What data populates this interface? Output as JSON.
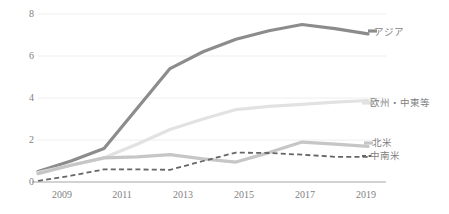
{
  "chart_data": {
    "type": "line",
    "title": "",
    "xlabel": "",
    "ylabel": "",
    "grid": true,
    "legend_position": "right-inline",
    "x": [
      2009,
      2010,
      2011,
      2012,
      2013,
      2014,
      2015,
      2016,
      2017,
      2018,
      2019
    ],
    "x_tick_labels": [
      "2009",
      "2011",
      "2013",
      "2015",
      "2017",
      "2019"
    ],
    "x_ticks": [
      2009,
      2011,
      2013,
      2015,
      2017,
      2019
    ],
    "y_tick_labels": [
      "0",
      "2",
      "4",
      "6",
      "8"
    ],
    "y_ticks": [
      0,
      2,
      4,
      6,
      8
    ],
    "ylim": [
      0,
      8
    ],
    "xlim": [
      2009,
      2019
    ],
    "series": [
      {
        "name": "アジア",
        "color": "#8c8c8c",
        "style": "solid",
        "width": 3.2,
        "values": [
          0.5,
          1.0,
          1.6,
          3.5,
          5.4,
          6.2,
          6.8,
          7.2,
          7.5,
          7.3,
          7.05
        ]
      },
      {
        "name": "欧州・中東等",
        "color": "#e2e2e2",
        "style": "solid",
        "width": 3.2,
        "values": [
          0.45,
          0.8,
          1.15,
          1.8,
          2.5,
          3.0,
          3.45,
          3.6,
          3.7,
          3.8,
          3.88
        ]
      },
      {
        "name": "北米",
        "color": "#c6c6c6",
        "style": "solid",
        "width": 3.2,
        "values": [
          0.4,
          0.8,
          1.15,
          1.2,
          1.3,
          1.1,
          0.95,
          1.4,
          1.9,
          1.8,
          1.7
        ]
      },
      {
        "name": "中南米",
        "color": "#666666",
        "style": "dashed",
        "width": 1.8,
        "values": [
          0.05,
          0.3,
          0.6,
          0.6,
          0.58,
          1.0,
          1.4,
          1.38,
          1.3,
          1.2,
          1.2
        ]
      }
    ]
  },
  "axis": {
    "y_labels": [
      "8",
      "6",
      "4",
      "2",
      "0"
    ],
    "x_labels": [
      "2009",
      "2011",
      "2013",
      "2015",
      "2017",
      "2019"
    ]
  },
  "labels": {
    "asia": "アジア",
    "europe_middle_east": "欧州・中東等",
    "north_america": "北米",
    "latin_america": "中南米"
  },
  "colors": {
    "asia": "#8c8c8c",
    "europe_middle_east": "#e2e2e2",
    "north_america": "#c6c6c6",
    "latin_america": "#666666",
    "gridline": "#eeeeee",
    "axis": "#a6a6a6",
    "text": "#7f7f7f",
    "background": "#ffffff"
  }
}
